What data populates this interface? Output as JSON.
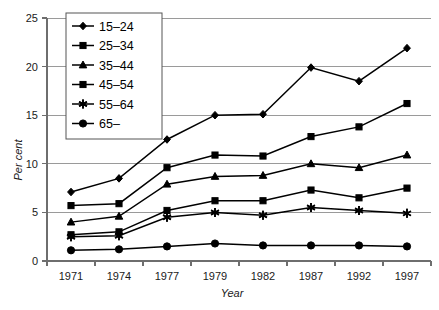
{
  "chart_data": {
    "type": "line",
    "title": "",
    "subtitle": "",
    "xlabel": "Year",
    "ylabel": "Per cent",
    "categories": [
      "1971",
      "1974",
      "1977",
      "1979",
      "1982",
      "1987",
      "1992",
      "1997"
    ],
    "x_tick_labels": [
      "1971",
      "1974",
      "1977",
      "1979",
      "1982",
      "1987",
      "1992",
      "1997"
    ],
    "y_tick_labels": [
      "0",
      "5",
      "10",
      "15",
      "20",
      "25"
    ],
    "y_ticks": [
      0,
      5,
      10,
      15,
      20,
      25
    ],
    "ylim": [
      0,
      25
    ],
    "grid": "horizontal",
    "legend_position": "top-left-inside",
    "series": [
      {
        "name": "15–24",
        "marker": "diamond",
        "values": [
          7.1,
          8.5,
          12.5,
          15.0,
          15.1,
          19.9,
          18.5,
          21.9
        ]
      },
      {
        "name": "25–34",
        "marker": "square",
        "values": [
          5.7,
          5.9,
          9.6,
          10.9,
          10.8,
          12.8,
          13.8,
          16.2
        ]
      },
      {
        "name": "35–44",
        "marker": "triangle",
        "values": [
          4.0,
          4.6,
          7.9,
          8.7,
          8.8,
          10.0,
          9.6,
          10.9
        ]
      },
      {
        "name": "45–54",
        "marker": "square",
        "values": [
          2.7,
          3.0,
          5.2,
          6.2,
          6.2,
          7.3,
          6.5,
          7.5
        ]
      },
      {
        "name": "55–64",
        "marker": "asterisk",
        "values": [
          2.5,
          2.6,
          4.5,
          5.0,
          4.7,
          5.5,
          5.2,
          4.9
        ]
      },
      {
        "name": "65–",
        "marker": "circle",
        "values": [
          1.1,
          1.2,
          1.5,
          1.8,
          1.6,
          1.6,
          1.6,
          1.5
        ]
      }
    ],
    "colors": {
      "line": "#000000",
      "marker": "#000000",
      "grid": "#9a9a9a",
      "axis": "#6e6e6e",
      "background": "#ffffff"
    }
  }
}
